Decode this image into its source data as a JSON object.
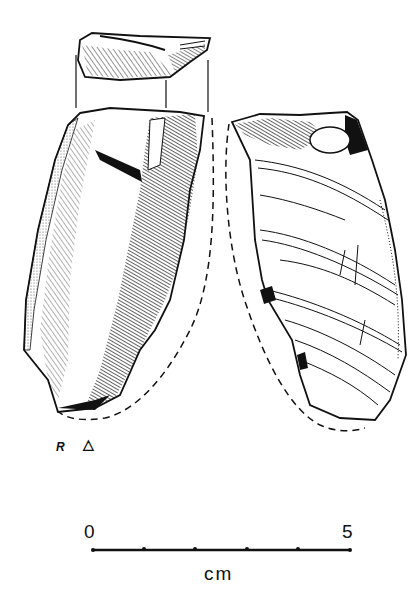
{
  "figure": {
    "views": [
      {
        "name": "platform-view",
        "description": "striking platform (top view)"
      },
      {
        "name": "dorsal-view",
        "description": "left view with hatched flake scars and cortex"
      },
      {
        "name": "ventral-view",
        "description": "right view with ripple lines"
      }
    ],
    "labels": {
      "side_marker": "R",
      "triangle_marker": "△"
    },
    "scale_bar": {
      "start_label": "0",
      "end_label": "5",
      "unit": "cm",
      "ticks": 6
    },
    "colors": {
      "ink": "#111111",
      "background": "#ffffff"
    }
  }
}
